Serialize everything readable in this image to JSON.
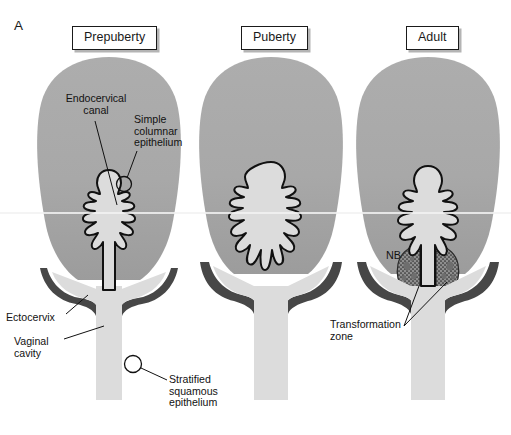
{
  "figure": {
    "letter": "A",
    "domain": "anatomical-diagram",
    "background_color": "#ffffff"
  },
  "colors": {
    "uterus_body": "#a9a9a9",
    "uterus_body_lower": "#9e9e9e",
    "cavity_light": "#dcdcdc",
    "ectocervix_dark": "#474747",
    "transformation_zone": "#8f8f8f",
    "nabothian_cyst": "#6e6e6e",
    "outline": "#111111",
    "label_box_border": "#1a1a1a",
    "label_box_shadow": "#b4b4b4",
    "scanline": "#f2f2f2",
    "text": "#121212"
  },
  "panels": [
    {
      "id": "prepuberty",
      "title": "Prepuberty",
      "title_x": 72,
      "title_y": 26,
      "center_x": 109
    },
    {
      "id": "puberty",
      "title": "Puberty",
      "title_x": 241,
      "title_y": 26,
      "center_x": 271
    },
    {
      "id": "adult",
      "title": "Adult",
      "title_x": 406,
      "title_y": 26,
      "center_x": 428
    }
  ],
  "annotations": [
    {
      "id": "endocervical-canal",
      "text": "Endocervical\ncanal",
      "panel": "prepuberty",
      "x": 48,
      "y": 93,
      "align": "center",
      "leader": {
        "x1": 95,
        "y1": 121,
        "x2": 117,
        "y2": 200
      }
    },
    {
      "id": "simple-columnar-epithelium",
      "text": "Simple\ncolumnar\nepithelium",
      "panel": "prepuberty",
      "x": 134,
      "y": 114,
      "align": "left",
      "leader": {
        "x1": 137,
        "y1": 151,
        "x2": 128,
        "y2": 180
      }
    },
    {
      "id": "ectocervix",
      "text": "Ectocervix",
      "panel": "prepuberty",
      "x": 6,
      "y": 312,
      "align": "left",
      "leader": {
        "x1": 66,
        "y1": 315,
        "x2": 86,
        "y2": 294
      }
    },
    {
      "id": "vaginal-cavity",
      "text": "Vaginal\ncavity",
      "panel": "prepuberty",
      "x": 14,
      "y": 336,
      "align": "left",
      "leader": {
        "x1": 64,
        "y1": 340,
        "x2": 104,
        "y2": 327
      }
    },
    {
      "id": "stratified-squamous-epithelium",
      "text": "Stratified\nsquamous\nepithelium",
      "panel": "prepuberty",
      "x": 169,
      "y": 378,
      "align": "left",
      "leader": {
        "x1": 167,
        "y1": 381,
        "x2": 140,
        "y2": 367
      }
    },
    {
      "id": "nb",
      "text": "NB",
      "panel": "adult",
      "x": 386,
      "y": 256,
      "align": "left",
      "leader": null
    },
    {
      "id": "transformation-zone",
      "text": "Transformation\nzone",
      "panel": "adult",
      "x": 330,
      "y": 324,
      "align": "left",
      "leaders": [
        {
          "x1": 404,
          "y1": 327,
          "x2": 418,
          "y2": 284
        },
        {
          "x1": 404,
          "y1": 327,
          "x2": 446,
          "y2": 281
        }
      ]
    }
  ],
  "callout_circles": [
    {
      "id": "columnar-epithelium-circle",
      "cx": 124,
      "cy": 184,
      "r": 7.5
    },
    {
      "id": "squamous-epithelium-circle",
      "cx": 133,
      "cy": 364,
      "r": 8.5
    }
  ],
  "structures": {
    "uterus_body": "bulbous gray corpus uteri",
    "endocervical_canal": "light wavy arborescent canal",
    "ectocervix": "dark band lining the outer cervix and vaginal fornices",
    "vaginal_cavity": "light central lumen below the cervix",
    "transformation_zone": "stippled everted columnar epithelium region, adult panel only",
    "nabothian_cysts": "NB - dark irregular inclusions within the transformation zone"
  },
  "scanline": {
    "y": 213,
    "visible": true
  }
}
